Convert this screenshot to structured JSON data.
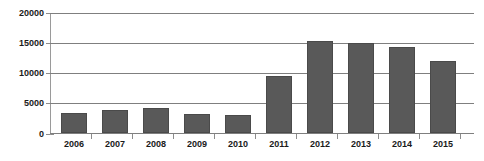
{
  "chart_data": {
    "type": "bar",
    "title": "",
    "xlabel": "",
    "ylabel": "",
    "categories": [
      "2006",
      "2007",
      "2008",
      "2009",
      "2010",
      "2011",
      "2012",
      "2013",
      "2014",
      "2015"
    ],
    "values": [
      3300,
      3800,
      4100,
      3200,
      3050,
      9550,
      15300,
      14950,
      14300,
      12000
    ],
    "ylim": [
      0,
      20000
    ],
    "yticks": [
      0,
      5000,
      10000,
      15000,
      20000
    ],
    "ytick_labels": [
      "0",
      "5000",
      "10000",
      "15000",
      "20000"
    ],
    "grid": true,
    "legend": false,
    "series_name": "",
    "colors": {
      "bar_fill": "#595959",
      "bar_edge": "#4a4a4a",
      "gridline": "#7f7f7f",
      "axis": "#8c8c8c",
      "text": "#1a1a1a",
      "background": "#ffffff"
    }
  }
}
